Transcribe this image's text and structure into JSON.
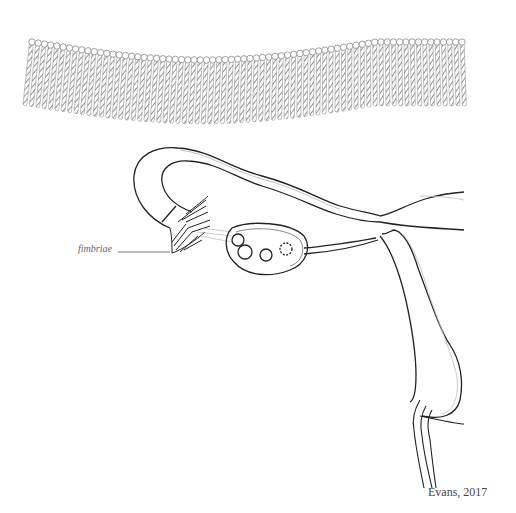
{
  "diagram": {
    "type": "anatomical illustration",
    "labels": {
      "fimbriae": "fimbriae"
    },
    "credit": "Evans, 2017",
    "parts": [
      {
        "name": "cilia-band",
        "description": "magnified row of cilia (top)"
      },
      {
        "name": "fallopian-tube"
      },
      {
        "name": "fimbriae"
      },
      {
        "name": "ovary",
        "follicles": 4
      },
      {
        "name": "ovarian-ligament"
      },
      {
        "name": "uterus"
      },
      {
        "name": "cervix-vagina"
      }
    ],
    "colors": {
      "line": "#222222",
      "cilia": "#8a8a8a",
      "inner-line": "#bbbbbb",
      "background": "#ffffff"
    }
  }
}
